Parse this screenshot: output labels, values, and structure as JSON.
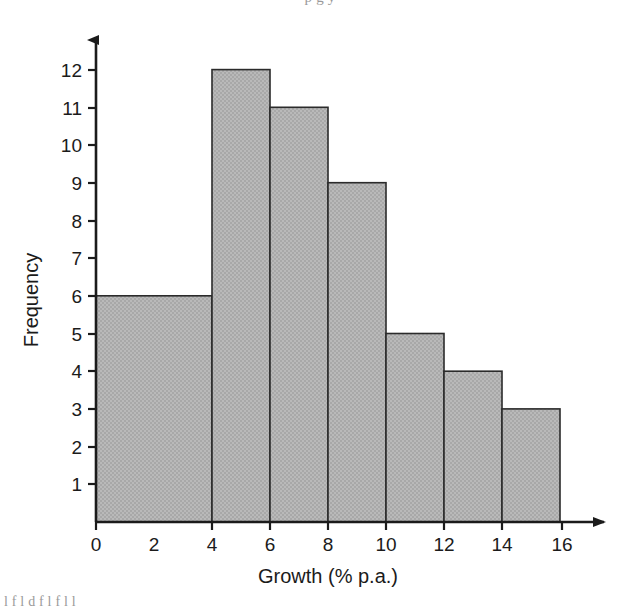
{
  "figure": {
    "background_color": "#ffffff",
    "cropped_text_top": "p g y",
    "cropped_text_bottom": "l f l d f l f l l"
  },
  "chart_data": {
    "type": "bar",
    "subtype": "histogram",
    "title": "",
    "xlabel": "Growth (% p.a.)",
    "ylabel": "Frequency",
    "xlim": [
      0,
      16
    ],
    "ylim": [
      0,
      12.6
    ],
    "xticks": [
      0,
      2,
      4,
      6,
      8,
      10,
      12,
      14,
      16
    ],
    "xtick_labels": [
      "0",
      "2",
      "4",
      "6",
      "8",
      "10",
      "12",
      "14",
      "16"
    ],
    "yticks": [
      1,
      2,
      3,
      4,
      5,
      6,
      7,
      8,
      9,
      10,
      11,
      12
    ],
    "ytick_labels": [
      "1",
      "2",
      "3",
      "4",
      "5",
      "6",
      "7",
      "8",
      "9",
      "10",
      "11",
      "12"
    ],
    "origin_label": "0",
    "grid": false,
    "legend": false,
    "bar_fill_color": "#b4b4b4",
    "bar_edge_color": "#2b2b2b",
    "axis_color": "#1b1b1b",
    "bins": [
      {
        "x0": 0,
        "x1": 4,
        "frequency": 6
      },
      {
        "x0": 4,
        "x1": 6,
        "frequency": 12
      },
      {
        "x0": 6,
        "x1": 8,
        "frequency": 11
      },
      {
        "x0": 8,
        "x1": 10,
        "frequency": 9
      },
      {
        "x0": 10,
        "x1": 12,
        "frequency": 5
      },
      {
        "x0": 12,
        "x1": 14,
        "frequency": 4
      },
      {
        "x0": 14,
        "x1": 16,
        "frequency": 3
      }
    ],
    "categories": [
      "0-4",
      "4-6",
      "6-8",
      "8-10",
      "10-12",
      "12-14",
      "14-16"
    ],
    "values": [
      6,
      12,
      11,
      9,
      5,
      4,
      3
    ]
  }
}
